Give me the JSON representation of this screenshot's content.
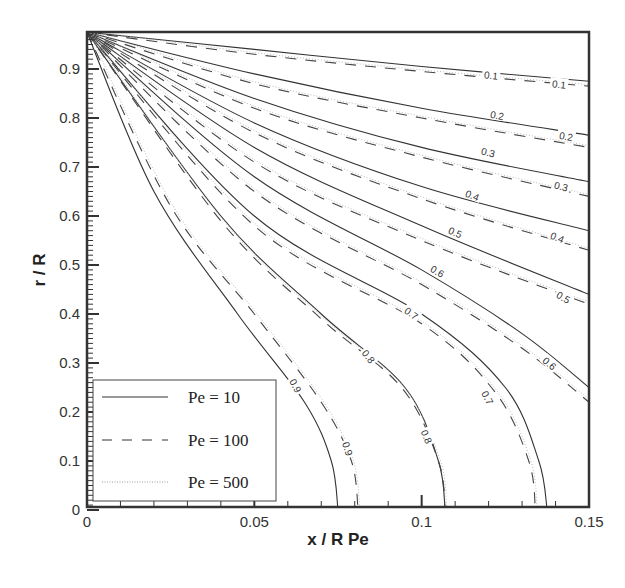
{
  "chart_data": {
    "type": "line",
    "subtype": "contour",
    "title": "",
    "xlabel": "x / R Pe",
    "ylabel": "r / R",
    "xlim": [
      0,
      0.15
    ],
    "ylim": [
      0,
      0.975
    ],
    "xticks": [
      0,
      0.05,
      0.1,
      0.15
    ],
    "xtick_labels": [
      "0",
      "0.05",
      "0.1",
      "0.15"
    ],
    "yticks": [
      0,
      0.1,
      0.2,
      0.3,
      0.4,
      0.5,
      0.6,
      0.7,
      0.8,
      0.9
    ],
    "ytick_labels": [
      "0",
      "0.1",
      "0.2",
      "0.3",
      "0.4",
      "0.5",
      "0.6",
      "0.7",
      "0.8",
      "0.9"
    ],
    "grid": false,
    "legend_position": "lower left",
    "legend": [
      {
        "label": "Pe = 10",
        "style": "solid"
      },
      {
        "label": "Pe = 100",
        "style": "dashed"
      },
      {
        "label": "Pe = 500",
        "style": "dotted"
      }
    ],
    "contour_levels": [
      0.1,
      0.2,
      0.3,
      0.4,
      0.5,
      0.6,
      0.7,
      0.8,
      0.9
    ],
    "series": [
      {
        "name": "Pe = 10",
        "style": "solid",
        "contours": [
          {
            "level": 0.1,
            "points": [
              [
                0,
                0.975
              ],
              [
                0.05,
                0.94
              ],
              [
                0.1,
                0.905
              ],
              [
                0.15,
                0.875
              ]
            ]
          },
          {
            "level": 0.2,
            "points": [
              [
                0,
                0.975
              ],
              [
                0.05,
                0.89
              ],
              [
                0.1,
                0.82
              ],
              [
                0.15,
                0.765
              ]
            ]
          },
          {
            "level": 0.3,
            "points": [
              [
                0,
                0.975
              ],
              [
                0.05,
                0.84
              ],
              [
                0.1,
                0.74
              ],
              [
                0.15,
                0.67
              ]
            ]
          },
          {
            "level": 0.4,
            "points": [
              [
                0,
                0.975
              ],
              [
                0.05,
                0.79
              ],
              [
                0.1,
                0.66
              ],
              [
                0.15,
                0.57
              ]
            ]
          },
          {
            "level": 0.5,
            "points": [
              [
                0,
                0.975
              ],
              [
                0.05,
                0.74
              ],
              [
                0.1,
                0.58
              ],
              [
                0.15,
                0.44
              ]
            ]
          },
          {
            "level": 0.6,
            "points": [
              [
                0,
                0.975
              ],
              [
                0.05,
                0.68
              ],
              [
                0.1,
                0.49
              ],
              [
                0.13,
                0.36
              ],
              [
                0.15,
                0.25
              ]
            ]
          },
          {
            "level": 0.7,
            "points": [
              [
                0,
                0.975
              ],
              [
                0.05,
                0.6
              ],
              [
                0.1,
                0.4
              ],
              [
                0.125,
                0.25
              ],
              [
                0.135,
                0.1
              ],
              [
                0.1375,
                0
              ]
            ]
          },
          {
            "level": 0.8,
            "points": [
              [
                0,
                0.975
              ],
              [
                0.04,
                0.6
              ],
              [
                0.07,
                0.4
              ],
              [
                0.095,
                0.25
              ],
              [
                0.105,
                0.1
              ],
              [
                0.107,
                0
              ]
            ]
          },
          {
            "level": 0.9,
            "points": [
              [
                0,
                0.975
              ],
              [
                0.02,
                0.65
              ],
              [
                0.045,
                0.4
              ],
              [
                0.065,
                0.22
              ],
              [
                0.073,
                0.1
              ],
              [
                0.075,
                0
              ]
            ]
          }
        ]
      },
      {
        "name": "Pe = 100",
        "style": "dashed",
        "contours": [
          {
            "level": 0.1,
            "points": [
              [
                0,
                0.975
              ],
              [
                0.05,
                0.93
              ],
              [
                0.1,
                0.895
              ],
              [
                0.15,
                0.865
              ]
            ]
          },
          {
            "level": 0.2,
            "points": [
              [
                0,
                0.975
              ],
              [
                0.05,
                0.87
              ],
              [
                0.1,
                0.8
              ],
              [
                0.15,
                0.74
              ]
            ]
          },
          {
            "level": 0.3,
            "points": [
              [
                0,
                0.975
              ],
              [
                0.05,
                0.82
              ],
              [
                0.1,
                0.72
              ],
              [
                0.15,
                0.64
              ]
            ]
          },
          {
            "level": 0.4,
            "points": [
              [
                0,
                0.975
              ],
              [
                0.05,
                0.77
              ],
              [
                0.1,
                0.635
              ],
              [
                0.15,
                0.53
              ]
            ]
          },
          {
            "level": 0.5,
            "points": [
              [
                0,
                0.975
              ],
              [
                0.05,
                0.71
              ],
              [
                0.1,
                0.55
              ],
              [
                0.15,
                0.42
              ]
            ]
          },
          {
            "level": 0.6,
            "points": [
              [
                0,
                0.975
              ],
              [
                0.05,
                0.65
              ],
              [
                0.1,
                0.46
              ],
              [
                0.13,
                0.33
              ],
              [
                0.15,
                0.22
              ]
            ]
          },
          {
            "level": 0.7,
            "points": [
              [
                0,
                0.975
              ],
              [
                0.05,
                0.58
              ],
              [
                0.1,
                0.38
              ],
              [
                0.122,
                0.24
              ],
              [
                0.132,
                0.1
              ],
              [
                0.134,
                0
              ]
            ]
          },
          {
            "level": 0.8,
            "points": [
              [
                0,
                0.975
              ],
              [
                0.04,
                0.59
              ],
              [
                0.07,
                0.39
              ],
              [
                0.094,
                0.25
              ],
              [
                0.105,
                0.1
              ],
              [
                0.107,
                0
              ]
            ]
          },
          {
            "level": 0.9,
            "points": [
              [
                0,
                0.975
              ],
              [
                0.025,
                0.62
              ],
              [
                0.05,
                0.4
              ],
              [
                0.07,
                0.22
              ],
              [
                0.079,
                0.1
              ],
              [
                0.081,
                0
              ]
            ]
          }
        ]
      },
      {
        "name": "Pe = 500",
        "style": "dotted",
        "contours": "nearly coincident with Pe = 100"
      }
    ],
    "annotations": [
      "0.1",
      "0.1",
      "0.2",
      "0.2",
      "0.3",
      "0.3",
      "0.4",
      "0.4",
      "0.5",
      "0.5",
      "0.6",
      "0.6",
      "0.7",
      "0.7",
      "0.8",
      "0.8",
      "0.9",
      "0.9"
    ]
  }
}
